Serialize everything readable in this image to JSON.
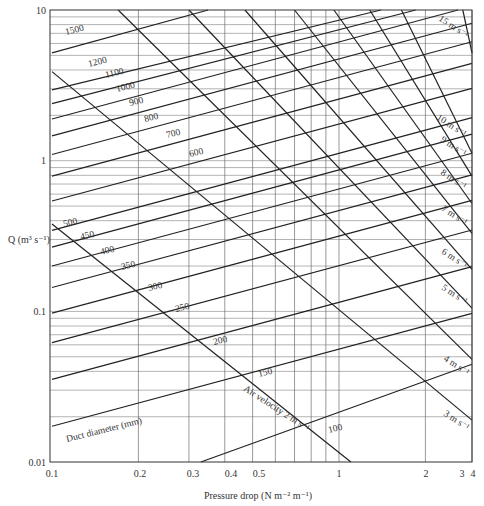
{
  "chart_data": {
    "type": "line",
    "title": "",
    "xlabel": "Pressure drop (N m⁻² m⁻¹)",
    "ylabel": "Q (m³ s⁻¹)",
    "xscale": "log",
    "yscale": "log",
    "xlim": [
      0.1,
      3.5
    ],
    "ylim": [
      0.01,
      10
    ],
    "x_ticks": [
      0.1,
      0.2,
      0.3,
      0.4,
      0.5,
      1,
      2,
      3,
      4
    ],
    "x_tick_labels": [
      "0.1",
      "0.2",
      "0.3",
      "0.4",
      "0.5",
      "1",
      "2",
      "3",
      "4"
    ],
    "y_ticks": [
      0.01,
      0.1,
      1,
      10
    ],
    "y_tick_labels": [
      "0.01",
      "0.1",
      "1",
      "10"
    ],
    "grid": true,
    "duct_diameter_series_label": "Duct diameter (mm)",
    "duct_diameters_mm": [
      100,
      150,
      200,
      250,
      300,
      350,
      400,
      450,
      500,
      600,
      700,
      800,
      900,
      1000,
      1100,
      1200,
      1500
    ],
    "duct_diameter_lines": [
      {
        "name": "100 mm",
        "points": [
          [
            0.33,
            0.01
          ],
          [
            3.5,
            0.0446
          ]
        ]
      },
      {
        "name": "150 mm",
        "points": [
          [
            0.1,
            0.0173
          ],
          [
            3.5,
            0.097
          ]
        ]
      },
      {
        "name": "200 mm",
        "points": [
          [
            0.1,
            0.0354
          ],
          [
            3.5,
            0.198
          ]
        ]
      },
      {
        "name": "250 mm",
        "points": [
          [
            0.1,
            0.062
          ],
          [
            3.5,
            0.347
          ]
        ]
      },
      {
        "name": "300 mm",
        "points": [
          [
            0.1,
            0.0975
          ],
          [
            3.5,
            0.546
          ]
        ]
      },
      {
        "name": "350 mm",
        "points": [
          [
            0.1,
            0.144
          ],
          [
            3.5,
            0.806
          ]
        ]
      },
      {
        "name": "400 mm",
        "points": [
          [
            0.1,
            0.2
          ],
          [
            3.5,
            1.12
          ]
        ]
      },
      {
        "name": "450 mm",
        "points": [
          [
            0.1,
            0.267
          ],
          [
            3.5,
            1.5
          ]
        ]
      },
      {
        "name": "500 mm",
        "points": [
          [
            0.1,
            0.345
          ],
          [
            3.5,
            1.93
          ]
        ]
      },
      {
        "name": "600 mm",
        "points": [
          [
            0.1,
            0.54
          ],
          [
            3.5,
            3.02
          ]
        ]
      },
      {
        "name": "700 mm",
        "points": [
          [
            0.1,
            0.79
          ],
          [
            3.5,
            4.42
          ]
        ]
      },
      {
        "name": "800 mm",
        "points": [
          [
            0.1,
            1.1
          ],
          [
            3.5,
            6.16
          ]
        ]
      },
      {
        "name": "900 mm",
        "points": [
          [
            0.1,
            1.46
          ],
          [
            3.5,
            8.17
          ]
        ]
      },
      {
        "name": "1000 mm",
        "points": [
          [
            0.1,
            1.89
          ],
          [
            2.6,
            10
          ]
        ]
      },
      {
        "name": "1100 mm",
        "points": [
          [
            0.1,
            2.39
          ],
          [
            1.85,
            10
          ]
        ]
      },
      {
        "name": "1200 mm",
        "points": [
          [
            0.1,
            2.95
          ],
          [
            1.4,
            10
          ]
        ]
      },
      {
        "name": "1500 mm",
        "points": [
          [
            0.1,
            5.2
          ],
          [
            0.35,
            10
          ]
        ]
      }
    ],
    "velocity_series_label": "Air velocity",
    "velocities_m_s": [
      2,
      3,
      4,
      5,
      6,
      7,
      8,
      9,
      10,
      15
    ],
    "velocity_lines": [
      {
        "name": "2 m s⁻¹",
        "points": [
          [
            0.1,
            0.38
          ],
          [
            1.1,
            0.01
          ]
        ]
      },
      {
        "name": "3 m s⁻¹",
        "points": [
          [
            0.1,
            3.9
          ],
          [
            3.5,
            0.019
          ]
        ]
      },
      {
        "name": "4 m s⁻¹",
        "points": [
          [
            0.17,
            10
          ],
          [
            3.5,
            0.048
          ]
        ]
      },
      {
        "name": "5 m s⁻¹",
        "points": [
          [
            0.3,
            10
          ],
          [
            3.5,
            0.105
          ]
        ]
      },
      {
        "name": "6 m s⁻¹",
        "points": [
          [
            0.47,
            10
          ],
          [
            3.5,
            0.19
          ]
        ]
      },
      {
        "name": "7 m s⁻¹",
        "points": [
          [
            0.7,
            10
          ],
          [
            3.5,
            0.33
          ]
        ]
      },
      {
        "name": "8 m s⁻¹",
        "points": [
          [
            0.96,
            10
          ],
          [
            3.5,
            0.52
          ]
        ]
      },
      {
        "name": "9 m s⁻¹",
        "points": [
          [
            1.28,
            10
          ],
          [
            3.5,
            0.79
          ]
        ]
      },
      {
        "name": "10 m s⁻¹",
        "points": [
          [
            1.65,
            10
          ],
          [
            3.5,
            1.12
          ]
        ]
      },
      {
        "name": "15 m s⁻¹",
        "points": [
          [
            2.7,
            10
          ],
          [
            3.5,
            5.2
          ]
        ]
      }
    ]
  },
  "labels": {
    "y_axis": "Q (m³ s⁻¹)",
    "x_axis": "Pressure drop (N m⁻² m⁻¹)",
    "duct_diameter": "Duct diameter (mm)",
    "air_velocity": "Air velocity 2 m s⁻¹",
    "v3": "3 m s⁻¹",
    "v4": "4 m s⁻¹",
    "v5": "5 m s⁻¹",
    "v6": "6 m s⁻¹",
    "v7": "7 m s⁻¹",
    "v8": "8 m s⁻¹",
    "v9": "9 m s⁻¹",
    "v10": "10 m s⁻¹",
    "v15": "15 m s⁻¹",
    "d100": "100",
    "d150": "150",
    "d200": "200",
    "d250": "250",
    "d300": "300",
    "d350": "350",
    "d400": "400",
    "d450": "450",
    "d500": "500",
    "d600": "600",
    "d700": "700",
    "d800": "800",
    "d900": "900",
    "d1000": "1000",
    "d1100": "1100",
    "d1200": "1200",
    "d1500": "1500",
    "xt_01": "0.1",
    "xt_02": "0.2",
    "xt_03": "0.3",
    "xt_04": "0.4",
    "xt_05": "0.5",
    "xt_1": "1",
    "xt_2": "2",
    "xt_3": "3",
    "xt_4": "4",
    "yt_001": "0.01",
    "yt_01": "0.1",
    "yt_1": "1",
    "yt_10": "10"
  }
}
